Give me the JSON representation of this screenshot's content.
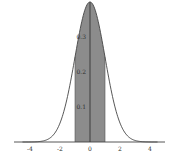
{
  "chart_data": {
    "type": "area",
    "title": "",
    "xlabel": "",
    "ylabel": "",
    "xlim": [
      -4.5,
      4.5
    ],
    "ylim": [
      0,
      0.4
    ],
    "x_ticks": [
      "-4",
      "-2",
      "0",
      "2",
      "4"
    ],
    "y_ticks": [
      "0.1",
      "0.2",
      "0.3"
    ],
    "shaded_region": {
      "from": -1,
      "to": 1
    },
    "grid": false,
    "series": [
      {
        "name": "N(0,1) density",
        "x": [
          -4.5,
          -4,
          -3.5,
          -3,
          -2.5,
          -2,
          -1.5,
          -1,
          -0.5,
          0,
          0.5,
          1,
          1.5,
          2,
          2.5,
          3,
          3.5,
          4,
          4.5
        ],
        "values": [
          0.0,
          0.0001,
          0.0009,
          0.0044,
          0.0175,
          0.054,
          0.1295,
          0.242,
          0.3521,
          0.3989,
          0.3521,
          0.242,
          0.1295,
          0.054,
          0.0175,
          0.0044,
          0.0009,
          0.0001,
          0.0
        ]
      }
    ],
    "colors": {
      "curve": "#444444",
      "fill": "#8c8c8c",
      "axis": "#444444"
    }
  }
}
